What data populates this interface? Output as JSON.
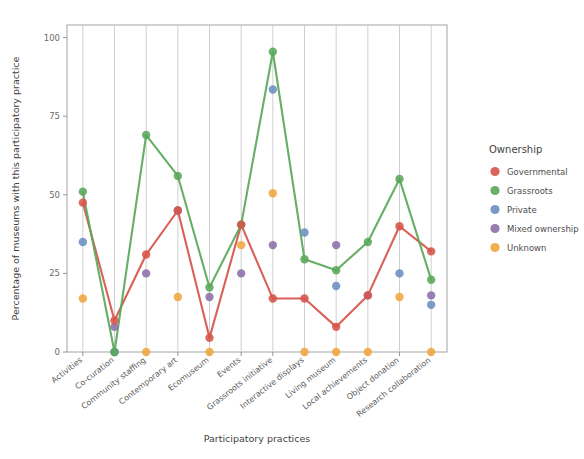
{
  "chart_data": {
    "type": "line",
    "title": "",
    "xlabel": "Participatory practices",
    "ylabel": "Percentage of museums with this participatory practice",
    "ylim": [
      0,
      104
    ],
    "yticks": [
      0,
      25,
      50,
      75,
      100
    ],
    "ytick_labels": [
      "0",
      "25",
      "50",
      "75",
      "100"
    ],
    "grid": "vertical",
    "legend_position": "right",
    "legend_title": "Ownership",
    "categories": [
      "Activities",
      "Co-curation",
      "Community staffing",
      "Contemporary art",
      "Ecomuseum",
      "Events",
      "Grassroots initiative",
      "Interactive displays",
      "Living museum",
      "Local achievements",
      "Object donation",
      "Research collaboration"
    ],
    "series": [
      {
        "name": "Governmental",
        "color": "#d6544a",
        "line": true,
        "values": [
          47.5,
          10,
          31,
          45,
          4.5,
          40.5,
          17,
          17,
          8,
          18,
          40,
          32
        ]
      },
      {
        "name": "Grassroots",
        "color": "#5aa75a",
        "line": true,
        "values": [
          51,
          0,
          69,
          56,
          20.5,
          40.5,
          95.5,
          29.5,
          26,
          35,
          55,
          23
        ]
      },
      {
        "name": "Private",
        "color": "#6a8fc0",
        "line": false,
        "values": [
          35,
          0,
          null,
          null,
          null,
          null,
          83.5,
          38,
          21,
          null,
          25,
          15
        ]
      },
      {
        "name": "Mixed ownership",
        "color": "#8c6fa8",
        "line": false,
        "values": [
          null,
          8,
          25,
          45,
          17.5,
          25,
          34,
          null,
          34,
          18,
          null,
          18
        ]
      },
      {
        "name": "Unknown",
        "color": "#f0a63c",
        "line": false,
        "values": [
          17,
          0,
          0,
          17.5,
          0,
          34,
          50.5,
          0,
          0,
          0,
          17.5,
          0
        ]
      }
    ]
  },
  "legend": {
    "title": "Ownership",
    "items": [
      {
        "label": "Governmental",
        "color": "#d6544a"
      },
      {
        "label": "Grassroots",
        "color": "#5aa75a"
      },
      {
        "label": "Private",
        "color": "#6a8fc0"
      },
      {
        "label": "Mixed ownership",
        "color": "#8c6fa8"
      },
      {
        "label": "Unknown",
        "color": "#f0a63c"
      }
    ]
  }
}
